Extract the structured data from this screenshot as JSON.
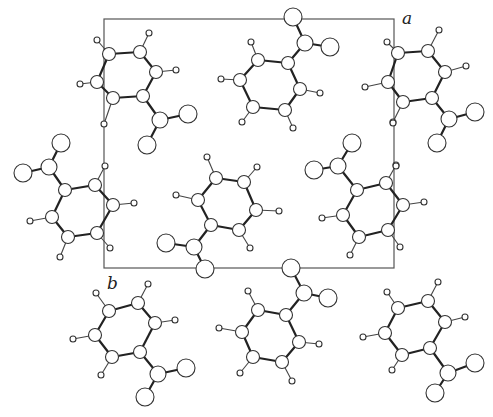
{
  "figure": {
    "axis_labels": {
      "a": "a",
      "b": "b"
    },
    "colors": {
      "line": "#555555",
      "bond": "#222222",
      "atom_fill": "#ffffff",
      "atom_stroke": "#333333"
    }
  },
  "molecules": [
    {
      "ring": [
        [
          109,
          54
        ],
        [
          140,
          52
        ],
        [
          156,
          72
        ],
        [
          143,
          96
        ],
        [
          113,
          98
        ],
        [
          97,
          82
        ]
      ],
      "h": [
        [
          97,
          40,
          0
        ],
        [
          149,
          33,
          1
        ],
        [
          176,
          70,
          2
        ],
        [
          104,
          124,
          4
        ],
        [
          80,
          84,
          5
        ]
      ],
      "c": [
        160,
        120
      ],
      "o": [
        [
          188,
          114
        ],
        [
          147,
          145
        ]
      ],
      "ca": 3
    },
    {
      "ring": [
        [
          288,
          63
        ],
        [
          258,
          60
        ],
        [
          240,
          80
        ],
        [
          253,
          107
        ],
        [
          285,
          110
        ],
        [
          300,
          89
        ]
      ],
      "h": [
        [
          251,
          42,
          1
        ],
        [
          221,
          79,
          2
        ],
        [
          242,
          122,
          3
        ],
        [
          293,
          128,
          4
        ],
        [
          320,
          93,
          5
        ]
      ],
      "c": [
        305,
        43
      ],
      "o": [
        [
          293,
          17
        ],
        [
          330,
          47
        ]
      ],
      "ca": 0
    },
    {
      "ring": [
        [
          398,
          53
        ],
        [
          428,
          51
        ],
        [
          445,
          72
        ],
        [
          432,
          98
        ],
        [
          403,
          102
        ],
        [
          388,
          82
        ]
      ],
      "h": [
        [
          387,
          42,
          0
        ],
        [
          439,
          30,
          1
        ],
        [
          466,
          66,
          2
        ],
        [
          393,
          122,
          4
        ],
        [
          365,
          87,
          5
        ]
      ],
      "c": [
        449,
        119
      ],
      "o": [
        [
          475,
          112
        ],
        [
          437,
          143
        ]
      ],
      "ca": 3
    },
    {
      "ring": [
        [
          65,
          190
        ],
        [
          95,
          185
        ],
        [
          113,
          205
        ],
        [
          97,
          233
        ],
        [
          68,
          237
        ],
        [
          52,
          217
        ]
      ],
      "h": [
        [
          105,
          166,
          1
        ],
        [
          134,
          203,
          2
        ],
        [
          110,
          248,
          3
        ],
        [
          60,
          257,
          4
        ],
        [
          30,
          221,
          5
        ]
      ],
      "c": [
        49,
        167
      ],
      "o": [
        [
          61,
          143
        ],
        [
          23,
          173
        ]
      ],
      "ca": 0
    },
    {
      "ring": [
        [
          216,
          178
        ],
        [
          244,
          182
        ],
        [
          256,
          210
        ],
        [
          239,
          230
        ],
        [
          211,
          225
        ],
        [
          198,
          200
        ]
      ],
      "h": [
        [
          207,
          157,
          0
        ],
        [
          257,
          167,
          1
        ],
        [
          279,
          211,
          2
        ],
        [
          250,
          248,
          3
        ],
        [
          176,
          195,
          5
        ]
      ],
      "c": [
        194,
        247
      ],
      "o": [
        [
          166,
          243
        ],
        [
          205,
          269
        ]
      ],
      "ca": 4
    },
    {
      "ring": [
        [
          357,
          190
        ],
        [
          386,
          183
        ],
        [
          403,
          205
        ],
        [
          388,
          230
        ],
        [
          359,
          237
        ],
        [
          343,
          215
        ]
      ],
      "h": [
        [
          396,
          165,
          1
        ],
        [
          424,
          202,
          2
        ],
        [
          400,
          247,
          3
        ],
        [
          350,
          255,
          4
        ],
        [
          322,
          218,
          5
        ]
      ],
      "c": [
        338,
        166
      ],
      "o": [
        [
          352,
          143
        ],
        [
          314,
          170
        ]
      ],
      "ca": 0
    },
    {
      "ring": [
        [
          109,
          311
        ],
        [
          138,
          303
        ],
        [
          155,
          323
        ],
        [
          140,
          352
        ],
        [
          112,
          357
        ],
        [
          95,
          335
        ]
      ],
      "h": [
        [
          96,
          293,
          0
        ],
        [
          148,
          284,
          1
        ],
        [
          175,
          320,
          2
        ],
        [
          101,
          375,
          4
        ],
        [
          73,
          339,
          5
        ]
      ],
      "c": [
        158,
        374
      ],
      "o": [
        [
          186,
          368
        ],
        [
          145,
          397
        ]
      ],
      "ca": 3
    },
    {
      "ring": [
        [
          286,
          315
        ],
        [
          258,
          310
        ],
        [
          242,
          332
        ],
        [
          253,
          357
        ],
        [
          282,
          362
        ],
        [
          299,
          342
        ]
      ],
      "h": [
        [
          248,
          291,
          1
        ],
        [
          219,
          328,
          2
        ],
        [
          240,
          373,
          3
        ],
        [
          292,
          381,
          4
        ],
        [
          319,
          344,
          5
        ]
      ],
      "c": [
        304,
        293
      ],
      "o": [
        [
          291,
          268
        ],
        [
          328,
          298
        ]
      ],
      "ca": 0
    },
    {
      "ring": [
        [
          398,
          308
        ],
        [
          428,
          301
        ],
        [
          445,
          322
        ],
        [
          430,
          348
        ],
        [
          402,
          355
        ],
        [
          385,
          333
        ]
      ],
      "h": [
        [
          387,
          292,
          0
        ],
        [
          438,
          282,
          1
        ],
        [
          465,
          317,
          2
        ],
        [
          392,
          370,
          4
        ],
        [
          363,
          337,
          5
        ]
      ],
      "c": [
        448,
        373
      ],
      "o": [
        [
          475,
          363
        ],
        [
          435,
          393
        ]
      ],
      "ca": 3
    }
  ],
  "extra_h": [
    [
      393,
      123
    ],
    [
      396,
      166
    ]
  ]
}
